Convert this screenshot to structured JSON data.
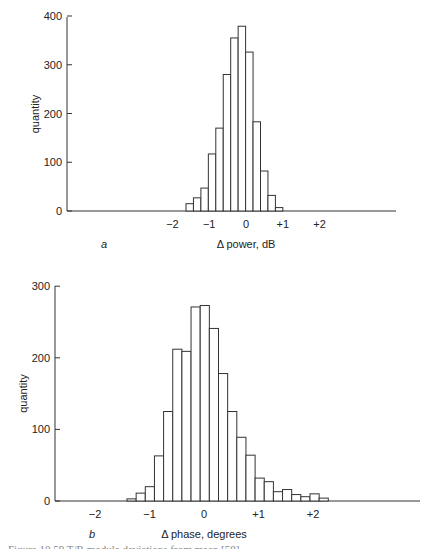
{
  "chart_data": [
    {
      "type": "bar",
      "panel": "a",
      "title": "",
      "xlabel": "Δ power, dB",
      "ylabel": "quantity",
      "ylim": [
        0,
        400
      ],
      "yticks": [
        0,
        100,
        200,
        300,
        400
      ],
      "xticks": [
        "−2",
        "−1",
        "0",
        "+1",
        "+2"
      ],
      "xtick_values": [
        -2,
        -1,
        0,
        1,
        2
      ],
      "bin_width": 0.2,
      "bin_start": -1.6,
      "categories": [
        "-1.6",
        "-1.4",
        "-1.2",
        "-1.0",
        "-0.8",
        "-0.6",
        "-0.4",
        "-0.2",
        "0.0",
        "0.2",
        "0.4",
        "0.6",
        "0.8"
      ],
      "values": [
        15,
        27,
        47,
        117,
        170,
        280,
        355,
        379,
        326,
        183,
        82,
        32,
        7
      ],
      "grid": false,
      "layout": {
        "x0": 67,
        "y0": 211,
        "yscale": 0.4875,
        "xunit": 36.8,
        "xzero": 246,
        "axis_end": 396,
        "bar_left": 186,
        "bar_px": 7.45,
        "ytop": 17
      }
    },
    {
      "type": "bar",
      "panel": "b",
      "title": "",
      "xlabel": "Δ phase, degrees",
      "ylabel": "quantity",
      "ylim": [
        0,
        300
      ],
      "yticks": [
        0,
        100,
        200,
        300
      ],
      "xticks": [
        "−2",
        "−1",
        "0",
        "+1",
        "+2"
      ],
      "xtick_values": [
        -2,
        -1,
        0,
        1,
        2
      ],
      "bin_width": 0.17,
      "bin_start": -1.35,
      "categories": [
        "b1",
        "b2",
        "b3",
        "b4",
        "b5",
        "b6",
        "b7",
        "b8",
        "b9",
        "b10",
        "b11",
        "b12",
        "b13",
        "b14",
        "b15",
        "b16",
        "b17",
        "b18",
        "b19",
        "b20",
        "b21",
        "b22"
      ],
      "values": [
        3,
        11,
        20,
        63,
        125,
        212,
        209,
        271,
        273,
        241,
        178,
        125,
        89,
        64,
        32,
        27,
        13,
        16,
        9,
        6,
        10,
        4
      ],
      "grid": false,
      "layout": {
        "x0": 55,
        "y0": 501,
        "yscale": 0.716,
        "xunit": 54.5,
        "xzero": 204,
        "axis_end": 420,
        "bar_left": 127,
        "bar_px": 9.15,
        "ytop": 286
      }
    }
  ],
  "figure": {
    "panel_a_label": "a",
    "panel_b_label": "b",
    "caption": "Figure 10.59   T/R module deviations from mean  [58]"
  }
}
